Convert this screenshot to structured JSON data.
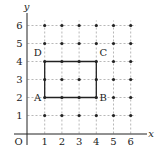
{
  "diagram": {
    "axis_labels": {
      "x": "x",
      "y": "y",
      "origin": "O"
    },
    "x_ticks": [
      "1",
      "2",
      "3",
      "4",
      "5",
      "6"
    ],
    "y_ticks": [
      "1",
      "2",
      "3",
      "4",
      "5",
      "6"
    ],
    "grid": {
      "x_range": [
        1,
        6
      ],
      "y_range": [
        1,
        6
      ],
      "dots_at_integer_points": true,
      "dashed_gridlines": true
    },
    "rectangle": {
      "vertices": [
        {
          "label": "A",
          "x": 1,
          "y": 2
        },
        {
          "label": "B",
          "x": 4,
          "y": 2
        },
        {
          "label": "C",
          "x": 4,
          "y": 4
        },
        {
          "label": "D",
          "x": 1,
          "y": 4
        }
      ]
    },
    "colors": {
      "ink": "#222222",
      "grid": "#888888"
    }
  }
}
